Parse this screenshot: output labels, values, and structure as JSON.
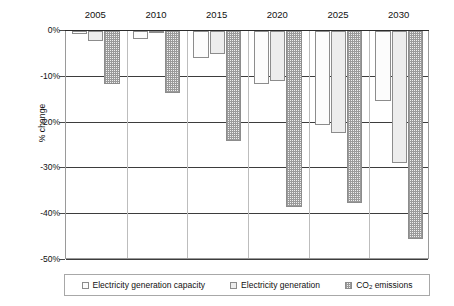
{
  "chart_data": {
    "type": "bar",
    "title": "",
    "xlabel": "",
    "ylabel": "% change",
    "categories": [
      "2005",
      "2010",
      "2015",
      "2020",
      "2025",
      "2030"
    ],
    "ylim": [
      -50,
      0
    ],
    "ytick_labels": [
      "0%",
      "-10%",
      "-20%",
      "-30%",
      "-40%",
      "-50%"
    ],
    "ytick_values": [
      0,
      -10,
      -20,
      -30,
      -40,
      -50
    ],
    "grid": true,
    "legend_position": "bottom",
    "series": [
      {
        "name": "Electricity generation capacity",
        "values": [
          -0.6,
          -1.8,
          -6.0,
          -11.5,
          -20.5,
          -15.3
        ]
      },
      {
        "name": "Electricity generation",
        "values": [
          -2.2,
          -0.3,
          -5.0,
          -11.0,
          -22.3,
          -28.8
        ]
      },
      {
        "name": "CO2 emissions",
        "values": [
          -11.5,
          -13.5,
          -24.0,
          -38.5,
          -37.5,
          -45.5
        ]
      }
    ]
  },
  "axis": {
    "y_title": "% change",
    "y_ticks": [
      "0%",
      "-10%",
      "-20%",
      "-30%",
      "-40%",
      "-50%"
    ],
    "x_ticks": [
      "2005",
      "2010",
      "2015",
      "2020",
      "2025",
      "2030"
    ]
  },
  "legend": {
    "items": [
      {
        "label": "Electricity generation capacity",
        "pattern": "fine-dot"
      },
      {
        "label": "Electricity generation",
        "pattern": "solid-light"
      },
      {
        "label": "CO",
        "sub": "2",
        "suffix": " emissions",
        "pattern": "checker"
      }
    ]
  },
  "colors": {
    "series1": "#fcfcfc",
    "series2": "#ededed",
    "series3": "#9a9a9a",
    "gridline": "#3d3d3d",
    "frame": "#9a9a9a",
    "text": "#111111"
  }
}
